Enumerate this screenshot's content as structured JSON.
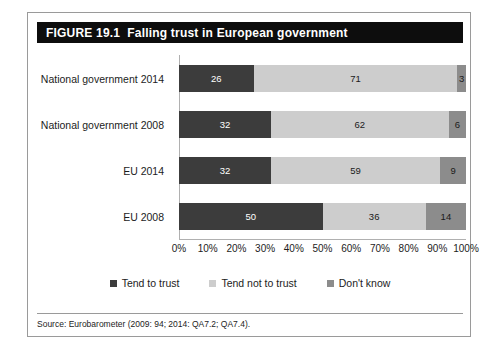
{
  "figure": {
    "number": "FIGURE 19.1",
    "title": "Falling trust in European government",
    "source": "Source: Eurobarometer (2009: 94; 2014: QA7.2; QA7.4)."
  },
  "colors": {
    "banner_background": "#0d0d0d",
    "banner_text": "#ffffff",
    "tend_to_trust": "#3c3c3c",
    "tend_not_to_trust": "#cdcdcd",
    "dont_know": "#8c8c8c",
    "frame_border": "#9a9a9a"
  },
  "legend": {
    "items": [
      {
        "label": "Tend to trust",
        "color": "#3c3c3c"
      },
      {
        "label": "Tend not to trust",
        "color": "#cdcdcd"
      },
      {
        "label": "Don't know",
        "color": "#8c8c8c"
      }
    ]
  },
  "chart_data": {
    "type": "bar",
    "orientation": "horizontal",
    "stacked": true,
    "title": "Falling trust in European government",
    "xlabel": "",
    "ylabel": "",
    "xlim": [
      0,
      100
    ],
    "xticks": [
      "0%",
      "10%",
      "20%",
      "30%",
      "40%",
      "50%",
      "60%",
      "70%",
      "80%",
      "90%",
      "100%"
    ],
    "xtick_values": [
      0,
      10,
      20,
      30,
      40,
      50,
      60,
      70,
      80,
      90,
      100
    ],
    "grid": false,
    "legend_position": "bottom",
    "categories": [
      "National government 2014",
      "National government 2008",
      "EU 2014",
      "EU 2008"
    ],
    "series": [
      {
        "name": "Tend to trust",
        "values": [
          26,
          32,
          32,
          50
        ]
      },
      {
        "name": "Tend not to trust",
        "values": [
          71,
          62,
          59,
          36
        ]
      },
      {
        "name": "Don't know",
        "values": [
          3,
          6,
          9,
          14
        ]
      }
    ],
    "rows": [
      {
        "category": "National government 2014",
        "segments": [
          {
            "name": "Tend to trust",
            "value": 26,
            "label": "26"
          },
          {
            "name": "Tend not to trust",
            "value": 71,
            "label": "71"
          },
          {
            "name": "Don't know",
            "value": 3,
            "label": "3"
          }
        ]
      },
      {
        "category": "National government 2008",
        "segments": [
          {
            "name": "Tend to trust",
            "value": 32,
            "label": "32"
          },
          {
            "name": "Tend not to trust",
            "value": 62,
            "label": "62"
          },
          {
            "name": "Don't know",
            "value": 6,
            "label": "6"
          }
        ]
      },
      {
        "category": "EU 2014",
        "segments": [
          {
            "name": "Tend to trust",
            "value": 32,
            "label": "32"
          },
          {
            "name": "Tend not to trust",
            "value": 59,
            "label": "59"
          },
          {
            "name": "Don't know",
            "value": 9,
            "label": "9"
          }
        ]
      },
      {
        "category": "EU 2008",
        "segments": [
          {
            "name": "Tend to trust",
            "value": 50,
            "label": "50"
          },
          {
            "name": "Tend not to trust",
            "value": 36,
            "label": "36"
          },
          {
            "name": "Don't know",
            "value": 14,
            "label": "14"
          }
        ]
      }
    ]
  }
}
